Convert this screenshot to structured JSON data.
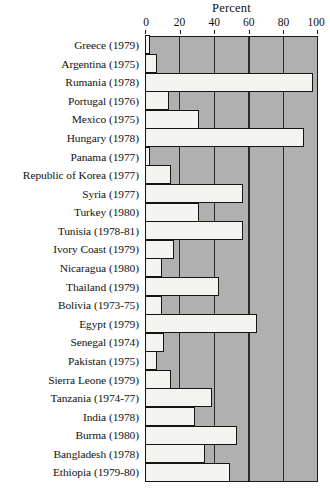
{
  "chart_data": {
    "type": "bar",
    "orientation": "horizontal",
    "title": "Percent",
    "xlabel": "Percent",
    "ylabel": "",
    "xlim": [
      0,
      100
    ],
    "xticks": [
      0,
      20,
      40,
      60,
      80,
      100
    ],
    "xtick_labels": [
      "0",
      "20",
      "40",
      "60",
      "80",
      "100"
    ],
    "grid": true,
    "legend": "none",
    "plot_background_color": "#b0b0b0",
    "bar_fill_color": "#f4f4f0",
    "bar_edge_color": "#141414",
    "categories": [
      "Greece (1979)",
      "Argentina (1975)",
      "Rumania (1978)",
      "Portugal (1976)",
      "Mexico (1975)",
      "Hungary (1978)",
      "Panama (1977)",
      "Republic of Korea (1977)",
      "Syria (1977)",
      "Turkey (1980)",
      "Tunisia (1978-81)",
      "Ivory Coast (1979)",
      "Nicaragua (1980)",
      "Thailand (1979)",
      "Bolivia (1973-75)",
      "Egypt (1979)",
      "Senegal (1974)",
      "Pakistan (1975)",
      "Sierra Leone (1979)",
      "Tanzania (1974-77)",
      "India (1978)",
      "Burma (1980)",
      "Bangladesh (1978)",
      "Ethiopia (1979-80)"
    ],
    "values": [
      2,
      6,
      96,
      13,
      30,
      91,
      2,
      14,
      56,
      30,
      56,
      16,
      9,
      42,
      9,
      64,
      10,
      6,
      14,
      38,
      28,
      52,
      34,
      48
    ]
  }
}
